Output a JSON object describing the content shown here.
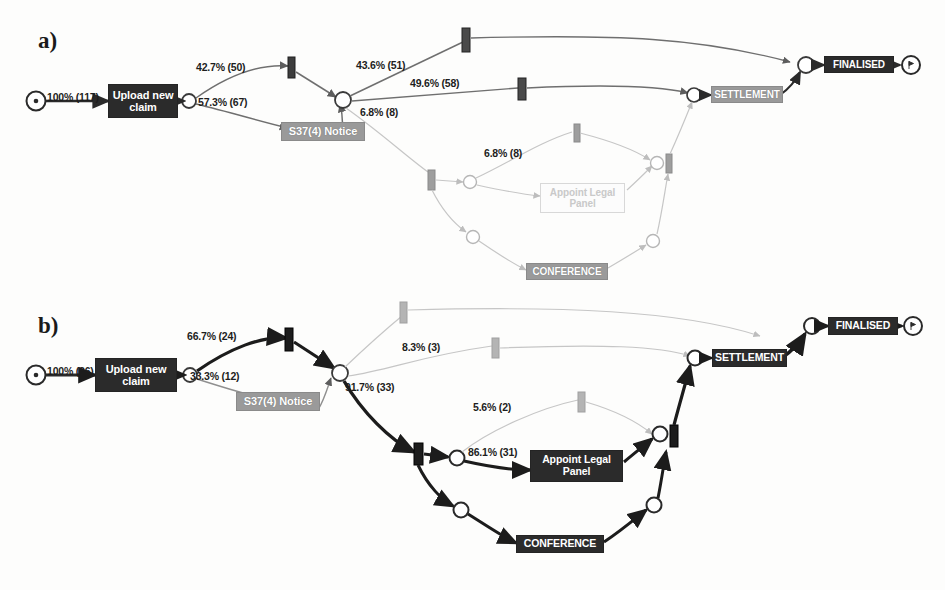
{
  "figure": {
    "type": "process-model-comparison",
    "notation": "petri-net",
    "panels": [
      {
        "id": "a",
        "letter": "a)",
        "case_count": 117,
        "start_event": "start-node",
        "end_event": "end-node",
        "activities": [
          {
            "name": "Upload new claim",
            "style": "dark"
          },
          {
            "name": "S37(4) Notice",
            "style": "gray"
          },
          {
            "name": "Appoint Legal Panel",
            "style": "ghost"
          },
          {
            "name": "CONFERENCE",
            "style": "gray"
          },
          {
            "name": "SETTLEMENT",
            "style": "gray"
          },
          {
            "name": "FINALISED",
            "style": "dark"
          }
        ],
        "edge_labels": [
          {
            "text": "100% (117)",
            "percent": "100%",
            "count": 117
          },
          {
            "text": "42.7% (50)",
            "percent": "42.7%",
            "count": 50
          },
          {
            "text": "57.3% (67)",
            "percent": "57.3%",
            "count": 67
          },
          {
            "text": "43.6% (51)",
            "percent": "43.6%",
            "count": 51
          },
          {
            "text": "49.6% (58)",
            "percent": "49.6%",
            "count": 58
          },
          {
            "text": "6.8% (8)",
            "percent": "6.8%",
            "count": 8
          },
          {
            "text": "6.8% (8)",
            "percent": "6.8%",
            "count": 8
          }
        ]
      },
      {
        "id": "b",
        "letter": "b)",
        "case_count": 36,
        "start_event": "start-node",
        "end_event": "end-node",
        "activities": [
          {
            "name": "Upload new claim",
            "style": "dark"
          },
          {
            "name": "S37(4) Notice",
            "style": "gray"
          },
          {
            "name": "Appoint Legal Panel",
            "style": "dark"
          },
          {
            "name": "CONFERENCE",
            "style": "dark"
          },
          {
            "name": "SETTLEMENT",
            "style": "dark"
          },
          {
            "name": "FINALISED",
            "style": "dark"
          }
        ],
        "edge_labels": [
          {
            "text": "100% (36)",
            "percent": "100%",
            "count": 36
          },
          {
            "text": "66.7% (24)",
            "percent": "66.7%",
            "count": 24
          },
          {
            "text": "33.3% (12)",
            "percent": "33.3%",
            "count": 12
          },
          {
            "text": "91.7% (33)",
            "percent": "91.7%",
            "count": 33
          },
          {
            "text": "8.3% (3)",
            "percent": "8.3%",
            "count": 3
          },
          {
            "text": "5.6% (2)",
            "percent": "5.6%",
            "count": 2
          },
          {
            "text": "86.1% (31)",
            "percent": "86.1%",
            "count": 31
          }
        ]
      }
    ],
    "colors": {
      "activity_dark": "#2b2b2b",
      "activity_gray": "#9a9a9a",
      "activity_ghost": "#fcfcfc",
      "arc_strong": "#2a2a2a",
      "arc_medium": "#6f6f6f",
      "arc_faint": "#c6c6c6",
      "background": "#fdfdfc"
    }
  }
}
